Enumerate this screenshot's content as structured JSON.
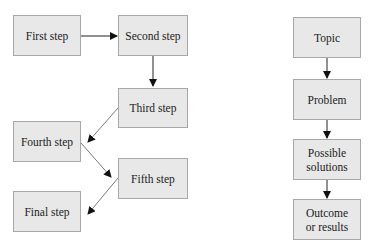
{
  "left_flow": {
    "first": "First step",
    "second": "Second step",
    "third": "Third step",
    "fourth": "Fourth step",
    "fifth": "Fifth step",
    "final": "Final step"
  },
  "right_flow": {
    "topic": "Topic",
    "problem": "Problem",
    "solutions": "Possible\nsolutions",
    "outcome": "Outcome\nor results"
  },
  "colors": {
    "box_fill": "#e8e8e8",
    "box_border": "#a8a8a8",
    "arrow_dark": "#111111",
    "arrow_diag": "#555555"
  }
}
